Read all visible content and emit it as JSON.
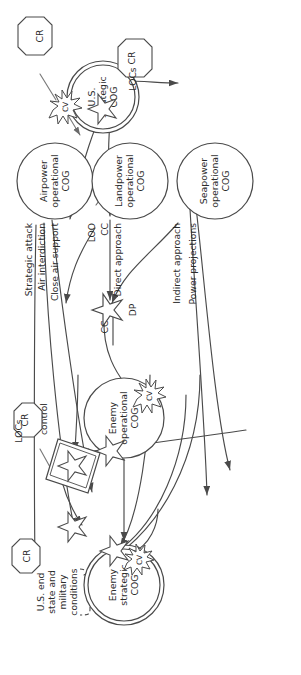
{
  "figure": {
    "type": "operational-design-diagram",
    "orientation": "rotated-90-ccw",
    "colors": {
      "stroke": "#4a4a4a",
      "text": "#2b2b2b",
      "background": "#ffffff",
      "shape_fill": "#ffffff"
    }
  },
  "nodes": {
    "us_strategic_cog": {
      "label": "U.S.\nstrategic\nCOG",
      "line1": "U.S.",
      "line2": "strategic",
      "line3": "COG",
      "shape": "double-circle"
    },
    "airpower_cog": {
      "line1": "Airpower",
      "line2": "operational",
      "line3": "COG",
      "shape": "circle"
    },
    "landpower_cog": {
      "line1": "Landpower",
      "line2": "operational",
      "line3": "COG",
      "shape": "circle"
    },
    "seapower_cog": {
      "line1": "Seapower",
      "line2": "operational",
      "line3": "COG",
      "shape": "circle"
    },
    "enemy_operational_cog": {
      "line1": "Enemy",
      "line2": "operational",
      "line3": "COG",
      "shape": "circle"
    },
    "enemy_strategic_cog": {
      "line1": "Enemy",
      "line2": "strategic",
      "line3": "COG",
      "shape": "double-circle"
    },
    "sea_control": {
      "line1": "Sea",
      "line2": "control",
      "shape": "parallelogram"
    }
  },
  "critical_requirements": [
    {
      "id": "cr_bottom_left",
      "label": "CR",
      "shape": "octagon"
    },
    {
      "id": "cr_bottom_right",
      "label": "CR",
      "shape": "octagon"
    },
    {
      "id": "cr_top_left",
      "label": "CR",
      "shape": "octagon"
    },
    {
      "id": "cr_top_right",
      "label": "CR",
      "shape": "octagon"
    }
  ],
  "vulnerability_bursts": [
    {
      "id": "cv_us_strategic",
      "label": "CV",
      "shape": "starburst"
    },
    {
      "id": "cv_enemy_operational",
      "label": "CV",
      "shape": "starburst"
    },
    {
      "id": "cv_enemy_strategic",
      "label": "CV",
      "shape": "starburst"
    }
  ],
  "decisive_points": [
    {
      "id": "dp_us",
      "label": "",
      "shape": "star"
    },
    {
      "id": "dp_main",
      "label": "DP",
      "shape": "star"
    },
    {
      "id": "dp_sea_control",
      "label": "",
      "shape": "star"
    },
    {
      "id": "dp_enemy_op",
      "label": "",
      "shape": "star"
    },
    {
      "id": "dp_enemy_strat",
      "label": "",
      "shape": "star"
    },
    {
      "id": "dp_near_cr",
      "label": "",
      "shape": "star"
    }
  ],
  "line_labels": {
    "strategic_attack": "Strategic attack",
    "air_interdiction": "Air interdiction",
    "close_air_support": "Close air support",
    "loo": "LOO",
    "cc_landpower": "CC",
    "direct_approach": "Direct approach",
    "indirect_approach": "Indirect approach",
    "power_projections": "Power projections",
    "cc_enemy_op": "CC",
    "locs_bottom": "LOCs",
    "locs_top": "LOCs",
    "dp": "DP"
  },
  "annotation": {
    "end_state_brace": "U.S. end\nstate and\nmilitary\nconditions",
    "end_state_line1": "U.S. end",
    "end_state_line2": "state and",
    "end_state_line3": "military",
    "end_state_line4": "conditions"
  }
}
